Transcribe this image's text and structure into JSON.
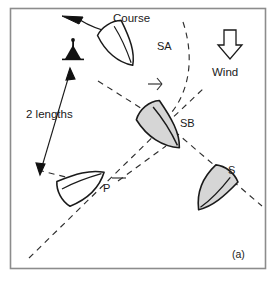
{
  "figure": {
    "panel_label": "(a)",
    "frame_color": "#8c8c8c",
    "background": "#ffffff",
    "line_color": "#1a1a1a",
    "dash_color": "#333333",
    "hull_fill_shaded": "#d6d6d6",
    "hull_fill_plain": "#ffffff"
  },
  "annotations": {
    "course_label": "Course",
    "wind_label": "Wind",
    "length_label": "2 lengths"
  },
  "icons": {
    "course_arrow": "curved-arrow-left-icon",
    "wind_arrow": "block-arrow-down-icon",
    "mark_buoy": "mark-buoy-icon",
    "length_arrow": "double-headed-arrow-icon"
  },
  "boats": [
    {
      "id": "SA",
      "label": "SA",
      "shaded": false,
      "label_x": 157,
      "label_y": 50
    },
    {
      "id": "SB",
      "label": "SB",
      "shaded": true,
      "label_x": 180,
      "label_y": 127
    },
    {
      "id": "P",
      "label": "P",
      "shaded": false,
      "label_x": 103,
      "label_y": 192
    },
    {
      "id": "S",
      "label": "S",
      "shaded": true,
      "label_x": 228,
      "label_y": 174
    }
  ]
}
